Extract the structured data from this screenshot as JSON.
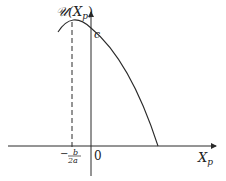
{
  "diagram": {
    "y_axis_label": "𝒰(X",
    "y_axis_label_sub": "p",
    "y_axis_label_close": ")",
    "y_intercept_label": "c",
    "x_axis_label": "X",
    "x_axis_label_sub": "p",
    "origin_label": "0",
    "vertex_label_minus": "−",
    "vertex_label_num": "b",
    "vertex_label_den": "2a",
    "colors": {
      "line": "#2a2a2a",
      "background": "#ffffff"
    }
  }
}
